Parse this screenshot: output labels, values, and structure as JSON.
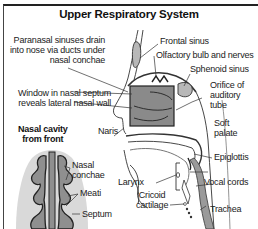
{
  "title": "Upper Respiratory System",
  "labels": {
    "paranasal_1": "Paranasal sinuses drain",
    "paranasal_2": "into nose via ducts under",
    "paranasal_3": "nasal conchae",
    "frontal_sinus": "Frontal sinus",
    "olfactory": "Olfactory bulb and nerves",
    "sphenoid": "Sphenoid sinus",
    "window_1": "Window in nasal septum",
    "window_2": "reveals lateral nasal wall",
    "orifice_1": "Orifice of",
    "orifice_2": "auditory",
    "orifice_3": "tube",
    "naris": "Naris",
    "soft_palate_1": "Soft",
    "soft_palate_2": "palate",
    "epiglottis": "Epiglottis",
    "larynx": "Larynx",
    "vocal_cords": "Vocal cords",
    "cricoid_1": "Cricoid",
    "cricoid_2": "cartilage",
    "trachea": "Trachea"
  },
  "inset": {
    "title_1": "Nasal cavity",
    "title_2": "from front",
    "nasal_conchae_1": "Nasal",
    "nasal_conchae_2": "conchae",
    "meati": "Meati",
    "septum": "Septum"
  },
  "colors": {
    "tissue_gray": "#9a9a9a",
    "light_gray": "#d9d9d9",
    "outline": "#222222"
  }
}
